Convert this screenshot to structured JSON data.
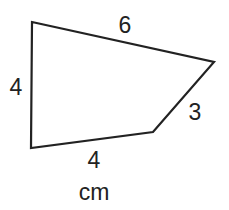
{
  "diagram": {
    "shape": "quadrilateral",
    "stroke_color": "#222222",
    "vertices": [
      [
        32,
        22
      ],
      [
        214,
        62
      ],
      [
        153,
        132
      ],
      [
        31,
        148
      ]
    ],
    "sides": [
      {
        "name": "top",
        "label": "6"
      },
      {
        "name": "right",
        "label": "3"
      },
      {
        "name": "bottom",
        "label": "4"
      },
      {
        "name": "left",
        "label": "4"
      }
    ],
    "unit": "cm"
  }
}
